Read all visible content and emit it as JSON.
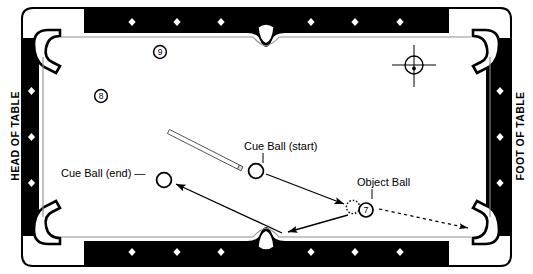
{
  "diagram": {
    "kind": "billiards-shot-diagram",
    "colors": {
      "rail": "#000000",
      "cloth": "#ffffff",
      "outline": "#000000",
      "cushion_line": "#8a8a8a",
      "diamond": "#ffffff"
    },
    "side_labels": {
      "left": "HEAD OF TABLE",
      "right": "FOOT OF TABLE"
    },
    "annotations": [
      {
        "id": "cue-ball-start",
        "text": "Cue Ball (start)"
      },
      {
        "id": "cue-ball-end",
        "text": "Cue Ball (end) —"
      },
      {
        "id": "object-ball",
        "text": "Object Ball"
      }
    ],
    "balls": [
      {
        "id": "ball-9",
        "number": "9",
        "style": "numbered-circle",
        "cx": 160,
        "cy": 52
      },
      {
        "id": "ball-8",
        "number": "8",
        "style": "numbered-circle",
        "cx": 101,
        "cy": 96
      },
      {
        "id": "ball-7",
        "number": "7",
        "style": "numbered-circle",
        "cx": 366,
        "cy": 210
      },
      {
        "id": "object-ball-ghost",
        "number": "",
        "style": "dotted-circle",
        "cx": 353,
        "cy": 207
      },
      {
        "id": "cue-ball-start",
        "number": "",
        "style": "open-circle",
        "cx": 256,
        "cy": 171
      },
      {
        "id": "cue-ball-end",
        "number": "",
        "style": "open-circle",
        "cx": 164,
        "cy": 180
      }
    ],
    "markers": {
      "foot_spot": {
        "id": "foot-spot-crosshair",
        "cx": 414,
        "cy": 65
      },
      "diamond_count_long_rail": 6,
      "diamond_count_short_rail": 3
    },
    "cue_stick": {
      "id": "cue-stick",
      "x1": 170,
      "y1": 131,
      "x2": 240,
      "y2": 167
    },
    "paths": [
      {
        "id": "path-cue-to-object",
        "style": "solid-arrow",
        "from": "cue-ball-start",
        "to": "object-ball"
      },
      {
        "id": "path-object-deflect-to-rail",
        "style": "solid-arrow",
        "from": "object-ball",
        "to": "bottom-side-pocket"
      },
      {
        "id": "path-rail-to-cue-end",
        "style": "solid-arrow",
        "from": "bottom-side-pocket",
        "to": "cue-ball-end"
      },
      {
        "id": "path-object-ball-travel",
        "style": "dashed-arrow",
        "from": "object-ball",
        "to": "bottom-right-pocket"
      }
    ]
  }
}
